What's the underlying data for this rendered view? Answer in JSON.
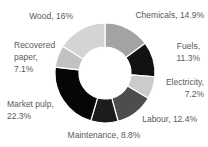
{
  "chart_data": {
    "type": "pie",
    "subtype": "donut",
    "title": "",
    "legend": "none",
    "direction": "clockwise",
    "start_angle_deg": 0,
    "inner_radius_ratio": 0.52,
    "background_color": "#ffffff",
    "label_color": "#595959",
    "categories": [
      "Chemicals",
      "Fuels",
      "Electricity",
      "Labour",
      "Maintenance",
      "Market pulp",
      "Recovered paper",
      "Wood"
    ],
    "values": [
      14.9,
      11.3,
      7.2,
      12.4,
      8.8,
      22.3,
      7.1,
      16
    ],
    "colors": [
      "#a3a3a3",
      "#121212",
      "#cbcbcb",
      "#4d4d4d",
      "#1c1c1c",
      "#060606",
      "#c2c2c2",
      "#d4d4d4"
    ],
    "labels": {
      "wood": "Wood, 16%",
      "chemicals": "Chemicals, 14.9%",
      "recovered_paper": "Recovered\npaper,\n7.1%",
      "fuels": "Fuels,\n11.3%",
      "market_pulp": "Market pulp,\n22.3%",
      "electricity": "Electricity,\n7.2%",
      "labour": "Labour, 12.4%",
      "maintenance": "Maintenance, 8.8%"
    }
  }
}
